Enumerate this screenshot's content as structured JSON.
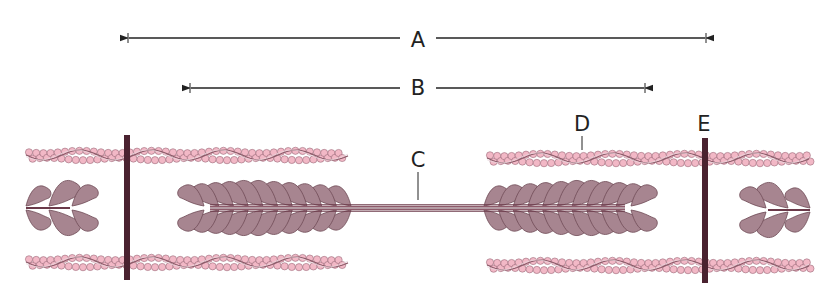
{
  "diagram": {
    "type": "sarcomere",
    "colors": {
      "background": "#ffffff",
      "actin_bead": "#f2b8c6",
      "actin_bead_stroke": "#9a6a78",
      "actin_strand": "#8a5a68",
      "myosin_head": "#a78590",
      "myosin_stroke": "#6e4a56",
      "myosin_core": "#6b3a4a",
      "z_line": "#4a2230",
      "arrow": "#222222"
    },
    "labels": {
      "A": {
        "text": "A",
        "x": 418,
        "y": 40
      },
      "B": {
        "text": "B",
        "x": 418,
        "y": 88
      },
      "C": {
        "text": "C",
        "x": 418,
        "y": 163
      },
      "D": {
        "text": "D",
        "x": 582,
        "y": 125
      },
      "E": {
        "text": "E",
        "x": 704,
        "y": 125
      }
    },
    "dimension_lines": [
      {
        "id": "A",
        "x1": 128,
        "x2": 706,
        "y": 38,
        "label_gap": [
          400,
          436
        ]
      },
      {
        "id": "B",
        "x1": 190,
        "x2": 645,
        "y": 88,
        "label_gap": [
          400,
          436
        ]
      }
    ],
    "leaders": [
      {
        "id": "C",
        "x": 418,
        "y1": 172,
        "y2": 200
      },
      {
        "id": "D",
        "x": 582,
        "y1": 136,
        "y2": 150
      }
    ],
    "z_lines": [
      {
        "x": 127,
        "y1": 135,
        "y2": 280,
        "width": 6
      },
      {
        "x": 705,
        "y1": 138,
        "y2": 283,
        "width": 6
      }
    ],
    "thin_filaments": [
      {
        "x1": 26,
        "x2": 348,
        "y": 155
      },
      {
        "x1": 26,
        "x2": 348,
        "y": 262
      },
      {
        "x1": 487,
        "x2": 810,
        "y": 158
      },
      {
        "x1": 487,
        "x2": 810,
        "y": 265
      }
    ],
    "thick_filaments": [
      {
        "x1": 190,
        "x2": 645,
        "y": 208,
        "bare_zone": [
          355,
          480
        ]
      },
      {
        "x1": 26,
        "x2": 80,
        "y": 208,
        "partial": "right"
      },
      {
        "x1": 758,
        "x2": 810,
        "y": 210,
        "partial": "left"
      }
    ]
  }
}
